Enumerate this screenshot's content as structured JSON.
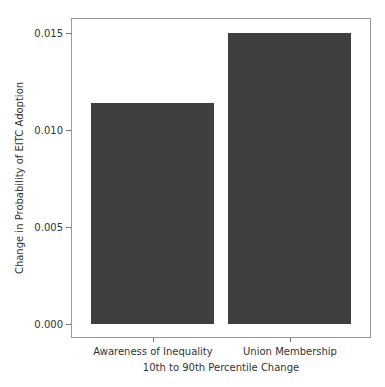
{
  "chart_data": {
    "type": "bar",
    "title": "",
    "xlabel": "10th to 90th Percentile Change",
    "ylabel": "Change in Probability of EITC Adoption",
    "categories": [
      "Awareness of Inequality",
      "Union Membership"
    ],
    "values": [
      0.0114,
      0.015
    ],
    "ylim": [
      -0.0007,
      0.0158
    ],
    "yticks": [
      "0.000",
      "0.005",
      "0.010",
      "0.015"
    ],
    "ytick_values": [
      0.0,
      0.005,
      0.01,
      0.015
    ],
    "grid": false,
    "legend": null,
    "bar_color": "#3f3f3f"
  }
}
